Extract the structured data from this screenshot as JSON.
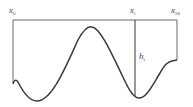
{
  "diagram": {
    "labels": {
      "x0": {
        "base": "x",
        "sub": "0"
      },
      "xi": {
        "base": "x",
        "sub": "i"
      },
      "x20": {
        "base": "x",
        "sub": "20"
      },
      "hi": {
        "base": "h",
        "sub": "i"
      }
    },
    "colors": {
      "stroke": "#555555",
      "text": "#444444",
      "background": "#ffffff"
    }
  }
}
